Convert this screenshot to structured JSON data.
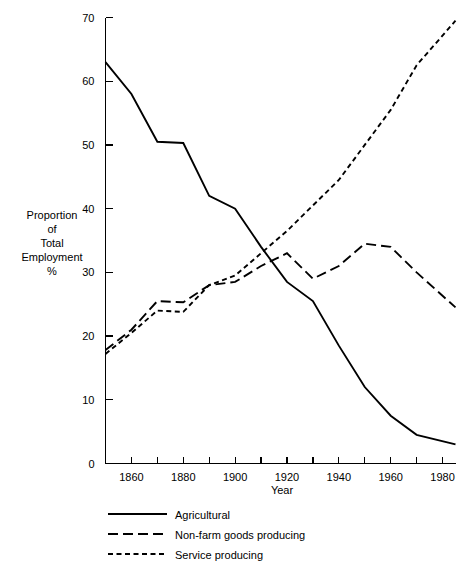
{
  "chart_data": {
    "type": "line",
    "title": "",
    "xlabel": "Year",
    "ylabel": "Proportion of Total Employment %",
    "ylabel_lines": [
      "Proportion",
      "of",
      "Total",
      "Employment",
      "%"
    ],
    "xlim": [
      1850,
      1985
    ],
    "ylim": [
      0,
      70
    ],
    "ytick_step": 10,
    "xtick_step": 10,
    "xtick_label_step": 20,
    "grid": false,
    "legend_position": "below-plot-left",
    "yticks": [
      0,
      10,
      20,
      30,
      40,
      50,
      60,
      70
    ],
    "ytick_labels": [
      "0",
      "10",
      "20",
      "30",
      "40",
      "50",
      "60",
      "70"
    ],
    "xticks": [
      1860,
      1870,
      1880,
      1890,
      1900,
      1910,
      1920,
      1930,
      1940,
      1950,
      1960,
      1970,
      1980
    ],
    "xtick_labels": [
      "1860",
      "",
      "1880",
      "",
      "1900",
      "",
      "1920",
      "",
      "1940",
      "",
      "1960",
      "",
      "1980"
    ],
    "x": [
      1850,
      1860,
      1870,
      1880,
      1890,
      1900,
      1910,
      1920,
      1930,
      1940,
      1950,
      1960,
      1970,
      1985
    ],
    "series": [
      {
        "name": "Agricultural",
        "style": "solid",
        "color": "#000000",
        "values": [
          63.0,
          58.0,
          50.5,
          50.3,
          42.0,
          40.0,
          34.0,
          28.5,
          25.5,
          18.5,
          12.0,
          7.5,
          4.5,
          3.0
        ]
      },
      {
        "name": "Non-farm goods producing",
        "style": "long-dash",
        "color": "#000000",
        "values": [
          17.8,
          21.0,
          25.5,
          25.3,
          28.0,
          28.5,
          31.0,
          33.0,
          29.0,
          31.0,
          34.5,
          34.0,
          30.0,
          24.5
        ]
      },
      {
        "name": "Service producing",
        "style": "short-dash",
        "color": "#000000",
        "values": [
          17.2,
          20.5,
          24.0,
          23.8,
          28.0,
          29.5,
          33.0,
          36.5,
          40.5,
          44.5,
          50.0,
          55.5,
          62.5,
          69.5
        ]
      }
    ]
  },
  "legend": {
    "items": [
      {
        "label": "Agricultural",
        "style": "solid"
      },
      {
        "label": "Non-farm goods producing",
        "style": "long-dash"
      },
      {
        "label": "Service producing",
        "style": "short-dash"
      }
    ]
  }
}
